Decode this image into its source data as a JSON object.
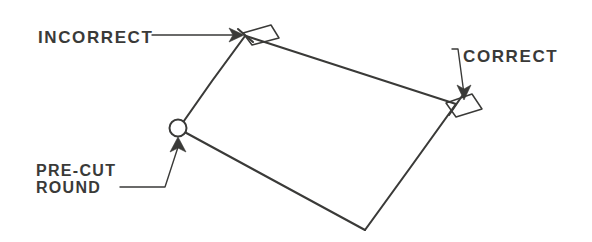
{
  "figure": {
    "background_color": "#ffffff",
    "ink_color": "#3a3a38",
    "width": 592,
    "height": 242
  },
  "annotations": {
    "incorrect": {
      "label": "INCORRECT",
      "text_x": 38,
      "text_y": 43,
      "leader_path": "M 152 35 L 243 35",
      "arrow_points": "243,35 230,29 233,35 230,41"
    },
    "correct": {
      "label": "CORRECT",
      "text_x": 462,
      "text_y": 62,
      "leader_path": "M 450 50 L 457 50 L 464 95",
      "arrow_points": "464,99 457,86 464,89 471,86"
    },
    "precut_round": {
      "label_line1": "PRE-CUT",
      "label_line2": "ROUND",
      "text_x": 36,
      "text_y1": 175,
      "text_y2": 191,
      "leader_path": "M 122 186 L 164 186 L 179 142",
      "arrow_points": "178,138 170,151 178,148 185,152"
    }
  },
  "geometry": {
    "panel_label": "tilted rectangular panel",
    "vertices": {
      "top": [
        245,
        35
      ],
      "right": [
        456,
        104
      ],
      "bottom": [
        365,
        230
      ],
      "left": [
        178,
        128
      ]
    },
    "panel_path": "M 245 35 L 456 104 L 365 230 L 178 128 Z",
    "round_corner": {
      "name": "pre-cut round corner",
      "cx": 178,
      "cy": 128,
      "r": 8.5
    },
    "cut_piece_top": {
      "name": "incorrect square cut offcut",
      "path": "M 243 33 L 270 26 L 278 38 L 251 44 Z"
    },
    "cut_piece_right": {
      "name": "correct mitre cut offcut",
      "path": "M 447 102 L 471 94 L 481 108 L 457 116 Z"
    },
    "tick_top": "M 237 30 L 252 41",
    "tick_right": "M 450 114 L 463 96"
  }
}
